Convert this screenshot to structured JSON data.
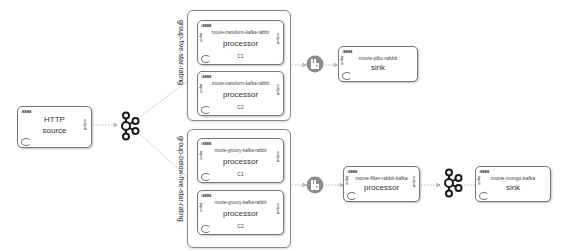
{
  "nodes": {
    "http_source": {
      "port": ":8888",
      "name": "HTTP",
      "type": "source",
      "side_out": "output"
    },
    "transform_c1": {
      "port": ":8888",
      "name": "movie-transform-kafka-rabbit",
      "type": "processor",
      "label": "C1",
      "side_in": "input",
      "side_out": "output"
    },
    "transform_c2": {
      "port": ":8888",
      "name": "movie-transform-kafka-rabbit",
      "type": "processor",
      "label": "C2",
      "side_in": "input",
      "side_out": "output"
    },
    "groovy_c1": {
      "port": ":8888",
      "name": "movie-groovy-kafka-rabbit",
      "type": "processor",
      "label": "C1",
      "side_in": "input",
      "side_out": "output"
    },
    "groovy_c2": {
      "port": ":8888",
      "name": "movie-groovy-kafka-rabbit",
      "type": "processor",
      "label": "C2",
      "side_in": "input",
      "side_out": "output"
    },
    "jdbc_sink": {
      "port": ":8888",
      "name": "movie-jdbc-rabbit",
      "type": "sink",
      "side_in": "input"
    },
    "filter_processor": {
      "port": ":8888",
      "name": "movie-filter-rabbit-kafka",
      "type": "processor",
      "side_in": "input",
      "side_out": "output"
    },
    "mongo_sink": {
      "port": ":8888",
      "name": "movie-mongo-kafka",
      "type": "sink",
      "side_in": "input"
    }
  },
  "groups": {
    "five_star": {
      "label": "group-five-star-rating"
    },
    "below_five_star": {
      "label": "group-below-five-star-rating"
    }
  },
  "brokers": {
    "kafka_1": {
      "icon": "kafka-icon"
    },
    "rabbit_1": {
      "icon": "rabbitmq-icon"
    },
    "rabbit_2": {
      "icon": "rabbitmq-icon"
    },
    "kafka_2": {
      "icon": "kafka-icon"
    }
  },
  "colors": {
    "rabbit_badge": "#8c8c8c",
    "kafka_stroke": "#1a1a1a",
    "edge": "#aaaaaa"
  }
}
